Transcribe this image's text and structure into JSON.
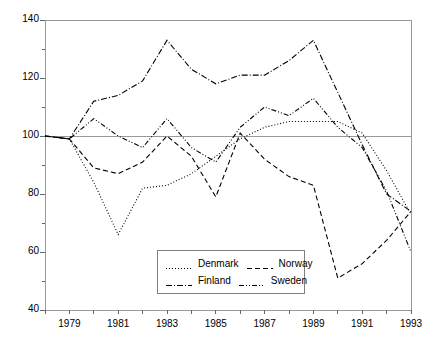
{
  "chart_data": {
    "type": "line",
    "title": "",
    "subtitle": "",
    "xlabel": "",
    "ylabel": "",
    "xlim": [
      1978,
      1993
    ],
    "ylim": [
      40,
      140
    ],
    "y_major_ticks": [
      40,
      60,
      80,
      100,
      120,
      140
    ],
    "y_minor_ticks": [
      50,
      70,
      90,
      110,
      130
    ],
    "y_tick_labels": [
      "40",
      "60",
      "80",
      "100",
      "120",
      "140"
    ],
    "x_ticks": [
      1978,
      1979,
      1980,
      1981,
      1982,
      1983,
      1984,
      1985,
      1986,
      1987,
      1988,
      1989,
      1990,
      1991,
      1992,
      1993
    ],
    "x_tick_labels": [
      "",
      "1979",
      "",
      "1981",
      "",
      "1983",
      "",
      "1985",
      "",
      "1987",
      "",
      "1989",
      "",
      "1991",
      "",
      "1993"
    ],
    "grid": false,
    "reference_lines": [
      100,
      140
    ],
    "legend_position": "bottom-center",
    "x": [
      1978,
      1979,
      1980,
      1981,
      1982,
      1983,
      1984,
      1985,
      1986,
      1987,
      1988,
      1989,
      1990,
      1991,
      1992,
      1993
    ],
    "series": [
      {
        "name": "Denmark",
        "style": "dotted",
        "color": "#000000",
        "values": [
          100,
          99,
          84,
          66,
          82,
          83,
          87,
          93,
          99,
          103,
          105,
          105,
          105,
          101,
          88,
          73
        ]
      },
      {
        "name": "Norway",
        "style": "dashed",
        "color": "#000000",
        "values": [
          100,
          99,
          89,
          87,
          91,
          100,
          93,
          79,
          101,
          92,
          86,
          83,
          51,
          56,
          64,
          74
        ]
      },
      {
        "name": "Finland",
        "style": "dash-dot",
        "color": "#000000",
        "values": [
          100,
          99,
          112,
          114,
          119,
          133,
          123,
          118,
          121,
          121,
          126,
          133,
          115,
          97,
          80,
          74
        ]
      },
      {
        "name": "Sweden",
        "style": "dash-dot-dot",
        "color": "#000000",
        "values": [
          100,
          99,
          106,
          100,
          96,
          106,
          96,
          91,
          103,
          110,
          107,
          113,
          103,
          96,
          81,
          60
        ]
      }
    ]
  },
  "legend": {
    "entries": [
      {
        "label": "Denmark",
        "style": "dotted"
      },
      {
        "label": "Norway",
        "style": "dashed"
      },
      {
        "label": "Finland",
        "style": "dash-dot"
      },
      {
        "label": "Sweden",
        "style": "dash-dot-dot"
      }
    ]
  }
}
